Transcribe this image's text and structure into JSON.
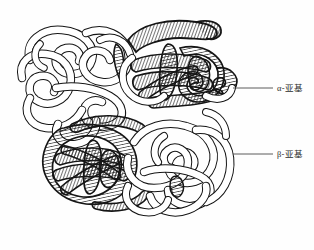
{
  "figure": {
    "title": "",
    "background_color": "#fefefe",
    "stroke_color": "#1a1a1a"
  },
  "labels": [
    {
      "id": "alpha",
      "text": "α-亚基",
      "leader_line": {
        "x1": 233,
        "y1": 88,
        "x2": 272,
        "y2": 88
      }
    },
    {
      "id": "beta",
      "text": "β-亚基",
      "leader_line": {
        "x1": 233,
        "y1": 154,
        "x2": 272,
        "y2": 154
      }
    }
  ],
  "subunits": [
    {
      "id": "alpha-upper-left",
      "type": "α",
      "shading": "plain",
      "center": [
        95,
        78
      ]
    },
    {
      "id": "beta-upper-right",
      "type": "β",
      "shading": "hatched",
      "center": [
        190,
        72
      ]
    },
    {
      "id": "beta-lower-left",
      "type": "β",
      "shading": "hatched",
      "center": [
        95,
        172
      ]
    },
    {
      "id": "alpha-lower-right",
      "type": "α",
      "shading": "plain",
      "center": [
        185,
        175
      ]
    }
  ]
}
